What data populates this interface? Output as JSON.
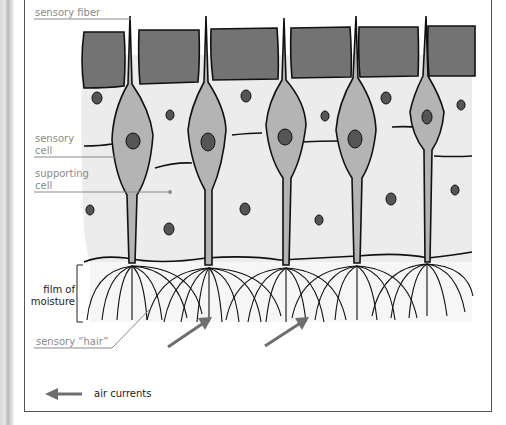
{
  "figure": {
    "labels": {
      "sensory_fiber": "sensory fiber",
      "sensory_cell_1": "sensory",
      "sensory_cell_2": "cell",
      "supporting_cell_1": "supporting",
      "supporting_cell_2": "cell",
      "film_1": "film of",
      "film_2": "moisture",
      "sensory_hair": "sensory “hair”",
      "air_currents": "air currents"
    },
    "colors": {
      "top_cells": "#737373",
      "epithelium": "#ececec",
      "sensory_cell": "#b4b4b4",
      "nucleus": "#555555",
      "outline": "#111111",
      "label_text": "#8a8a8a",
      "arrow": "#6e6e6e"
    },
    "sensory_cells_count": 5,
    "air_arrows_count": 2
  }
}
